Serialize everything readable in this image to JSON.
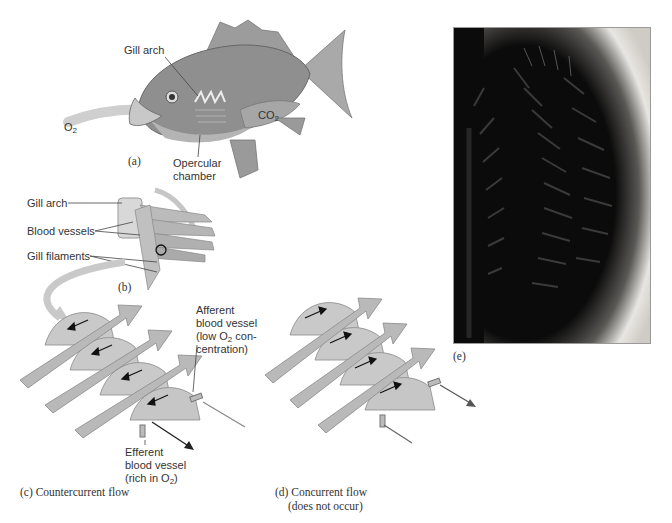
{
  "figure": {
    "panel_a": {
      "caption": "(a)",
      "labels": {
        "gill_arch": "Gill arch",
        "o2": "O",
        "o2_sub": "2",
        "co2": "CO",
        "co2_sub": "2",
        "opercular_line1": "Opercular",
        "opercular_line2": "chamber"
      }
    },
    "panel_b": {
      "caption": "(b)",
      "labels": {
        "gill_arch": "Gill arch",
        "blood_vessels": "Blood vessels",
        "gill_filaments": "Gill filaments"
      }
    },
    "panel_c": {
      "caption": "(c) Countercurrent flow",
      "afferent": {
        "line1": "Afferent",
        "line2": "blood vessel",
        "line3_pre": "(low O",
        "line3_sub": "2",
        "line3_post": " con-",
        "line4": "centration)"
      },
      "efferent": {
        "line1": "Efferent",
        "line2": "blood vessel",
        "line3_pre": "(rich in O",
        "line3_sub": "2",
        "line3_post": ")"
      }
    },
    "panel_d": {
      "caption_line1": "(d) Concurrent flow",
      "caption_line2": "(does not occur)"
    },
    "panel_e": {
      "caption": "(e)"
    },
    "colors": {
      "water_arrow": "#b9b9b9",
      "line": "#555555",
      "photo_bg": "#0b0b0b",
      "photo_edge": "#e8e6e2"
    }
  }
}
